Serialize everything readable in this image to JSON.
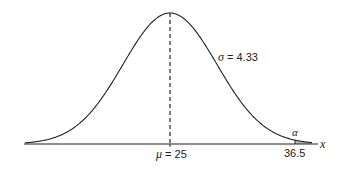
{
  "chart_data": {
    "type": "line",
    "title": "",
    "distribution": "normal",
    "mean": 25,
    "sigma": 4.33,
    "critical_value": 36.5,
    "tail_label": "α",
    "xlabel": "x",
    "ylabel": "",
    "grid": false,
    "annotations": {
      "mean_label": "μ = 25",
      "sigma_label": "σ = 4.33",
      "critical_label": "36.5",
      "alpha_label": "α",
      "axis_label": "x"
    }
  }
}
